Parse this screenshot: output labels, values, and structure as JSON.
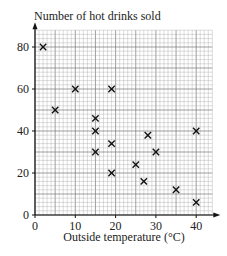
{
  "chart_data": {
    "type": "scatter",
    "title": "",
    "ylabel": "Number of hot drinks sold",
    "xlabel": "Outside temperature (°C)",
    "xlim": [
      0,
      44
    ],
    "ylim": [
      0,
      88
    ],
    "x_ticks": [
      0,
      10,
      20,
      30,
      40
    ],
    "y_ticks": [
      0,
      20,
      40,
      60,
      80
    ],
    "grid": true,
    "marker": "x",
    "points": [
      {
        "x": 2,
        "y": 80
      },
      {
        "x": 5,
        "y": 50
      },
      {
        "x": 10,
        "y": 60
      },
      {
        "x": 15,
        "y": 46
      },
      {
        "x": 15,
        "y": 40
      },
      {
        "x": 15,
        "y": 30
      },
      {
        "x": 19,
        "y": 60
      },
      {
        "x": 19,
        "y": 34
      },
      {
        "x": 19,
        "y": 20
      },
      {
        "x": 25,
        "y": 24
      },
      {
        "x": 27,
        "y": 16
      },
      {
        "x": 28,
        "y": 38
      },
      {
        "x": 30,
        "y": 30
      },
      {
        "x": 35,
        "y": 12
      },
      {
        "x": 40,
        "y": 40
      },
      {
        "x": 40,
        "y": 6
      }
    ]
  },
  "labels": {
    "y_axis_title": "Number of hot drinks sold",
    "x_axis_title": "Outside temperature (°C)"
  }
}
